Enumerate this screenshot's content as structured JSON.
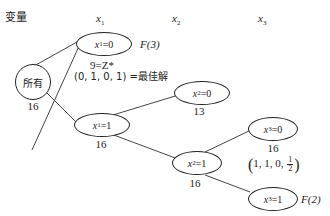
{
  "header": {
    "variables_label": "变量",
    "columns": [
      {
        "var": "x",
        "sub": "1"
      },
      {
        "var": "x",
        "sub": "2"
      },
      {
        "var": "x",
        "sub": "3"
      }
    ]
  },
  "nodes": {
    "root": {
      "label": "所有",
      "value": "16"
    },
    "x1_0": {
      "var": "x",
      "sub": "1",
      "eq": "=0",
      "tag": "F(3)",
      "note1": "9=Z*",
      "note2": "(0, 1, 0, 1) =最佳解"
    },
    "x1_1": {
      "var": "x",
      "sub": "1",
      "eq": "=1",
      "value": "16"
    },
    "x2_0": {
      "var": "x",
      "sub": "2",
      "eq": "=0",
      "value": "13"
    },
    "x2_1": {
      "var": "x",
      "sub": "2",
      "eq": "=1",
      "value": "16"
    },
    "x3_0": {
      "var": "x",
      "sub": "3",
      "eq": "=0",
      "value": "16",
      "solution": {
        "prefix": "1, 1, 0, ",
        "frac_num": "1",
        "frac_den": "2"
      }
    },
    "x3_1": {
      "var": "x",
      "sub": "3",
      "eq": "=1",
      "tag": "F(2)"
    }
  },
  "colors": {
    "stroke": "#222222",
    "background": "#ffffff"
  }
}
